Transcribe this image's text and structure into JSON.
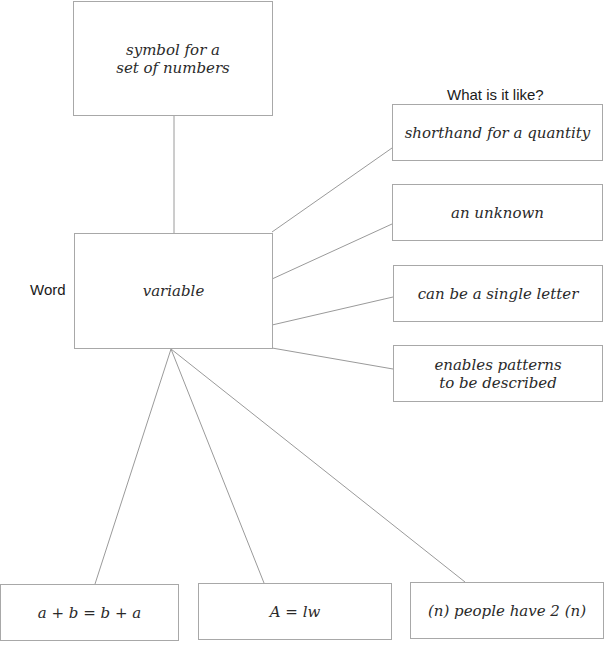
{
  "diagram": {
    "title_word_label": "Word",
    "characteristics_label": "What is it like?",
    "center": {
      "text": "variable"
    },
    "top": {
      "text": "symbol for a\nset of numbers"
    },
    "characteristics": [
      {
        "text": "shorthand for a quantity"
      },
      {
        "text": "an unknown"
      },
      {
        "text": "can be a single letter"
      },
      {
        "text": "enables patterns\nto be described"
      }
    ],
    "examples": [
      {
        "text": "a + b = b + a"
      },
      {
        "text": "A = lw"
      },
      {
        "text": "(n) people have 2 (n)"
      }
    ],
    "colors": {
      "border": "#a8a8a8",
      "line": "#9a9a9a",
      "text": "#2a2a2a"
    }
  }
}
